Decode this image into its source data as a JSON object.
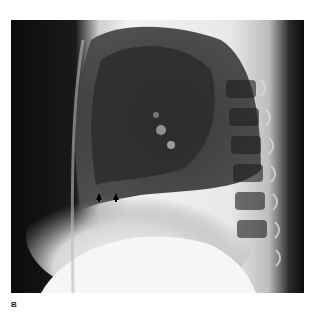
{
  "figure": {
    "panel_label": "B",
    "annotations": [
      {
        "type": "arrow",
        "direction": "up",
        "x": 99,
        "y": 196
      },
      {
        "type": "arrow",
        "direction": "up",
        "x": 116,
        "y": 196
      }
    ]
  }
}
